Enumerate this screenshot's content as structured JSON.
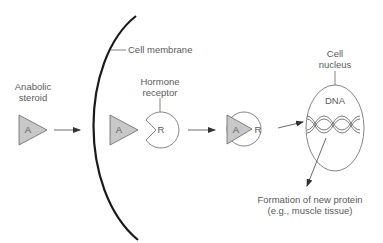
{
  "labels": {
    "anabolic_steroid": [
      "Anabolic",
      "steroid"
    ],
    "cell_membrane": "Cell membrane",
    "hormone_receptor": [
      "Hormone",
      "receptor"
    ],
    "cell_nucleus": [
      "Cell",
      "nucleus"
    ],
    "dna": "DNA",
    "formation": [
      "Formation of new protein",
      "(e.g., muscle tissue)"
    ]
  },
  "symbols": {
    "steroid": "A",
    "receptor": "R"
  },
  "colors": {
    "triangle_fill": "#c8c8c8",
    "stroke": "#555555",
    "membrane": "#1a1a1a"
  }
}
